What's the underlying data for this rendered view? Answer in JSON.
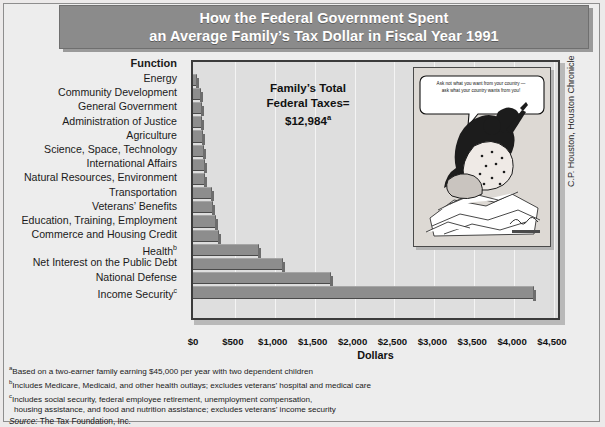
{
  "title": {
    "line1": "How the Federal Government Spent",
    "line2": "an Average Family’s Tax Dollar in Fiscal Year 1991"
  },
  "chart": {
    "function_header": "Function",
    "annotation": {
      "line1": "Family’s Total",
      "line2": "Federal Taxes=",
      "line3": "$12,984",
      "line3_sup": "a"
    },
    "xlabel": "Dollars",
    "cartoon": {
      "bubble_line1": "Ask not what you want from your country —",
      "bubble_line2": "ask what your country wants from you!"
    },
    "credit": "C.P. Houston, Houston Chronicle"
  },
  "chart_data": {
    "type": "bar",
    "orientation": "horizontal",
    "title": "How the Federal Government Spent an Average Family’s Tax Dollar in Fiscal Year 1991",
    "xlabel": "Dollars",
    "ylabel": "Function",
    "xlim": [
      0,
      4500
    ],
    "xticks": [
      "$0",
      "$500",
      "$1,000",
      "$1,500",
      "$2,000",
      "$2,500",
      "$3,000",
      "$3,500",
      "$4,000",
      "$4,500"
    ],
    "xtick_values": [
      0,
      500,
      1000,
      1500,
      2000,
      2500,
      3000,
      3500,
      4000,
      4500
    ],
    "grid": true,
    "legend": false,
    "categories": [
      "Energy",
      "Community Development",
      "General Government",
      "Administration of Justice",
      "Agriculture",
      "Science, Space, Technology",
      "International Affairs",
      "Natural Resources, Environment",
      "Transportation",
      "Veterans’ Benefits",
      "Education, Training, Employment",
      "Commerce and Housing Credit",
      "Health",
      "Net Interest on the Public Debt",
      "National Defense",
      "Income Security"
    ],
    "category_superscripts": [
      "",
      "",
      "",
      "",
      "",
      "",
      "",
      "",
      "",
      "",
      "",
      "",
      "b",
      "",
      "",
      "c"
    ],
    "values": [
      30,
      75,
      85,
      90,
      100,
      115,
      125,
      130,
      210,
      225,
      260,
      300,
      800,
      1100,
      1700,
      4250
    ],
    "units": "dollars per average family",
    "total_label": "Family’s Total Federal Taxes=",
    "total_value": "$12,984"
  },
  "footnotes": {
    "a": "Based on a two-earner family earning $45,000 per year with two dependent children",
    "b": "Includes Medicare, Medicaid, and other health outlays; excludes veterans’ hospital and medical care",
    "c_line1": "Includes social security, federal employee retirement, unemployment compensation,",
    "c_line2": "housing assistance, and food and nutrition assistance; excludes veterans’ income security",
    "source_prefix": "Source:",
    "source_text": " The Tax Foundation, Inc."
  },
  "colors": {
    "banner": "#8b8b8b",
    "bar": "#8d8d8d",
    "plot_bg": "#dedede",
    "page_bg": "#ededed"
  }
}
